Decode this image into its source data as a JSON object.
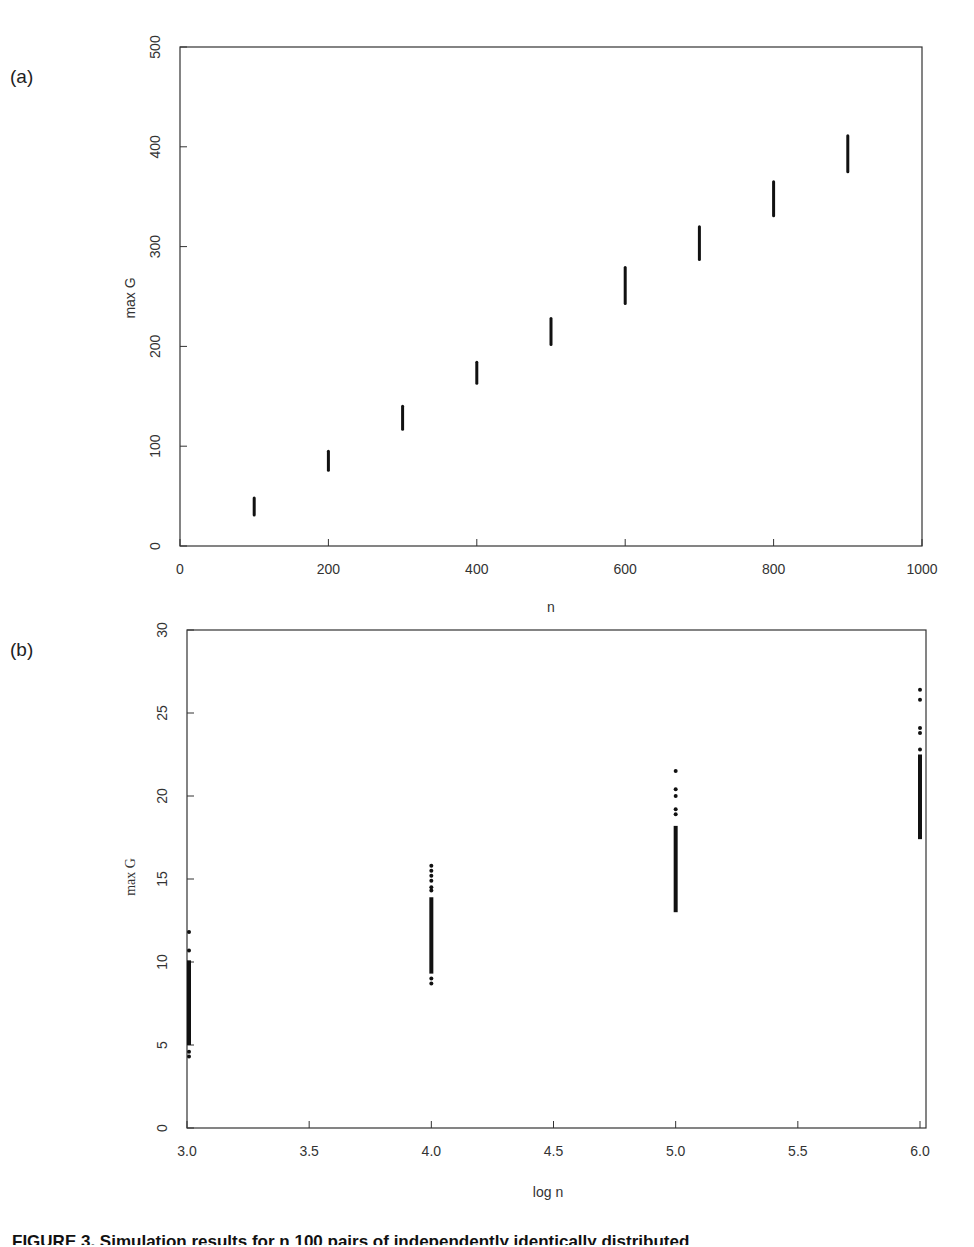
{
  "caption": "FIGURE 3. Simulation results for n 100 pairs of independently identically distributed",
  "chart_data": [
    {
      "type": "scatter",
      "panel_label": "(a)",
      "title": "",
      "xlabel": "n",
      "ylabel": "max G",
      "xlim": [
        0,
        1000
      ],
      "ylim": [
        0,
        500
      ],
      "x_ticks": [
        "0",
        "200",
        "400",
        "600",
        "800",
        "1000"
      ],
      "x_tick_values": [
        0,
        200,
        400,
        600,
        800,
        1000
      ],
      "y_ticks": [
        "0",
        "100",
        "200",
        "300",
        "400",
        "500"
      ],
      "y_tick_values": [
        0,
        100,
        200,
        300,
        400,
        500
      ],
      "grid": false,
      "series": [
        {
          "name": "max G range",
          "x": [
            100,
            200,
            300,
            400,
            500,
            600,
            700,
            800,
            900
          ],
          "y_min": [
            31,
            76,
            117,
            163,
            202,
            243,
            287,
            331,
            375
          ],
          "y_max": [
            48,
            95,
            140,
            184,
            228,
            279,
            320,
            365,
            411
          ]
        }
      ]
    },
    {
      "type": "scatter",
      "panel_label": "(b)",
      "title": "",
      "xlabel": "log n",
      "ylabel": "max G",
      "xlim": [
        3.0,
        6.0
      ],
      "ylim": [
        0,
        30
      ],
      "x_ticks": [
        "3.0",
        "3.5",
        "4.0",
        "4.5",
        "5.0",
        "5.5",
        "6.0"
      ],
      "x_tick_values": [
        3.0,
        3.5,
        4.0,
        4.5,
        5.0,
        5.5,
        6.0
      ],
      "y_ticks": [
        "0",
        "5",
        "10",
        "15",
        "20",
        "25",
        "30"
      ],
      "y_tick_values": [
        0,
        5,
        10,
        15,
        20,
        25,
        30
      ],
      "grid": false,
      "series": [
        {
          "name": "max G / log n",
          "clusters": [
            {
              "x": 3.0,
              "dense_min": 5.0,
              "dense_max": 10.1,
              "outliers": [
                11.8,
                10.7,
                4.6,
                4.3
              ]
            },
            {
              "x": 4.0,
              "dense_min": 9.3,
              "dense_max": 13.9,
              "outliers": [
                15.8,
                15.5,
                15.2,
                14.9,
                14.5,
                14.3,
                9.0,
                8.7
              ]
            },
            {
              "x": 5.0,
              "dense_min": 13.0,
              "dense_max": 18.2,
              "outliers": [
                21.5,
                20.4,
                20.0,
                19.2,
                18.9
              ]
            },
            {
              "x": 6.0,
              "dense_min": 17.4,
              "dense_max": 22.5,
              "outliers": [
                26.4,
                25.8,
                24.1,
                23.8,
                22.8
              ]
            }
          ]
        }
      ]
    }
  ]
}
